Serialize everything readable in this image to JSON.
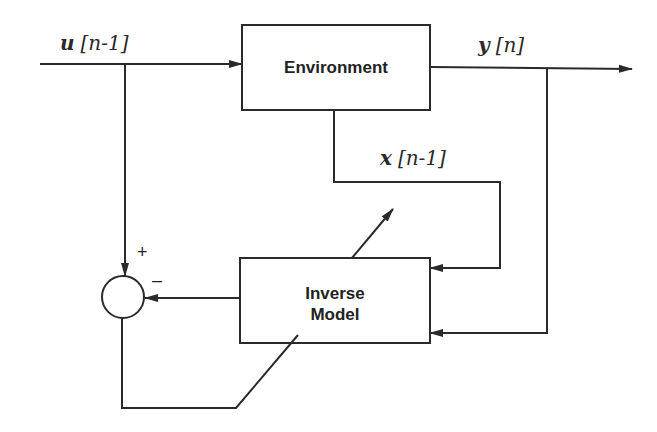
{
  "diagram": {
    "type": "block-diagram",
    "blocks": [
      {
        "id": "environment",
        "label": "Environment"
      },
      {
        "id": "inverse_model",
        "label_line1": "Inverse",
        "label_line2": "Model"
      }
    ],
    "summing_junction": {
      "plus_sign": "+",
      "minus_sign": "–"
    },
    "signals": {
      "input": {
        "var": "u",
        "index": "[n-1]"
      },
      "output": {
        "var": "y",
        "index": "[n]"
      },
      "state": {
        "var": "x",
        "index": "[n-1]"
      }
    },
    "colors": {
      "line": "#2a2a2a",
      "background": "#ffffff"
    }
  }
}
